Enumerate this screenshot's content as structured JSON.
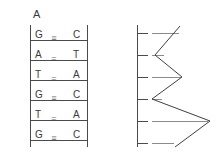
{
  "figure": {
    "panels": [
      {
        "id": "A",
        "label": "A",
        "label_x": 33,
        "label_y": 9,
        "type": "dna-ladder"
      },
      {
        "id": "B",
        "label": "B",
        "label_x": 157,
        "label_y": 9,
        "type": "trace"
      }
    ],
    "colors": {
      "line": "#4a4a4a",
      "text": "#3a3a3a",
      "dash": "#8a8a8a",
      "background": "#ffffff"
    }
  },
  "panel_a": {
    "label": "A",
    "base_pairs": [
      {
        "left": "G",
        "right": "C",
        "bond": "≡",
        "bonds": 3,
        "y": 30
      },
      {
        "left": "A",
        "right": "T",
        "bond": "=",
        "bonds": 2,
        "y": 50
      },
      {
        "left": "T",
        "right": "A",
        "bond": "=",
        "bonds": 2,
        "y": 70
      },
      {
        "left": "G",
        "right": "C",
        "bond": "≡",
        "bonds": 3,
        "y": 90
      },
      {
        "left": "T",
        "right": "A",
        "bond": "=",
        "bonds": 2,
        "y": 110
      },
      {
        "left": "G",
        "right": "C",
        "bond": "≡",
        "bonds": 3,
        "y": 130
      }
    ],
    "strand_left": "GATGTG",
    "strand_right": "CTACAC"
  },
  "chart_data": {
    "type": "line",
    "title": "B",
    "xlabel": "",
    "ylabel": "",
    "orientation": "vertical-axis-left",
    "grid": false,
    "legend": null,
    "axis": {
      "x_px": 25,
      "y_top_px": 25,
      "y_bottom_px": 147
    },
    "ticks": [
      {
        "index": 1,
        "y": 33
      },
      {
        "index": 2,
        "y": 55
      },
      {
        "index": 3,
        "y": 77
      },
      {
        "index": 4,
        "y": 99
      },
      {
        "index": 5,
        "y": 121
      },
      {
        "index": 6,
        "y": 143
      }
    ],
    "x": [
      1,
      2,
      3,
      4,
      5,
      6
    ],
    "values": [
      68,
      43,
      70,
      40,
      98,
      63
    ],
    "points_px": [
      {
        "x": 68,
        "y": 26
      },
      {
        "x": 43,
        "y": 55
      },
      {
        "x": 70,
        "y": 77
      },
      {
        "x": 40,
        "y": 99
      },
      {
        "x": 98,
        "y": 121
      },
      {
        "x": 63,
        "y": 147
      }
    ],
    "dash_segments": [
      {
        "y": 33,
        "x1": 40,
        "x2": 67
      },
      {
        "y": 55,
        "x1": 40,
        "x2": 52
      },
      {
        "y": 77,
        "x1": 40,
        "x2": 69
      },
      {
        "y": 99,
        "x1": 40,
        "x2": 50
      },
      {
        "y": 121,
        "x1": 40,
        "x2": 96
      },
      {
        "y": 143,
        "x1": 40,
        "x2": 62
      }
    ]
  }
}
